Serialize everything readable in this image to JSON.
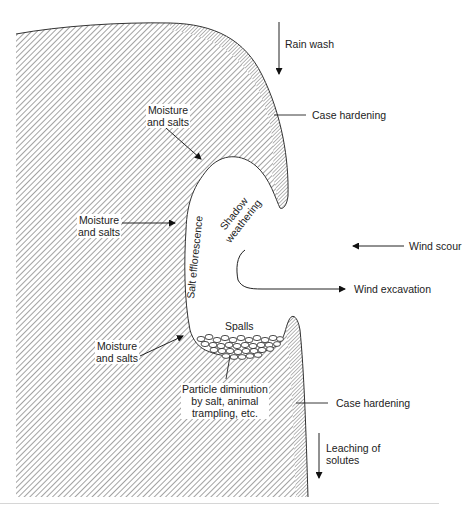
{
  "diagram": {
    "colors": {
      "rock_hatch": "#7a7a7a",
      "outline": "#333333",
      "text": "#222222",
      "background": "#ffffff"
    },
    "labels": {
      "rain_wash": "Rain wash",
      "case_hardening_top": "Case hardening",
      "moisture_top": [
        "Moisture",
        "and salts"
      ],
      "moisture_mid": [
        "Moisture",
        "and salts"
      ],
      "moisture_low": [
        "Moisture",
        "and salts"
      ],
      "salt_efflorescence": "Salt efflorescence",
      "shadow_weathering": [
        "Shadow",
        "weathering"
      ],
      "wind_scour": "Wind scour",
      "wind_excavation": "Wind excavation",
      "spalls": "Spalls",
      "particle_diminution": [
        "Particle diminution",
        "by salt, animal",
        "trampling, etc."
      ],
      "case_hardening_bottom": "Case hardening",
      "leaching": [
        "Leaching of",
        "solutes"
      ]
    },
    "arrows": [
      {
        "name": "rain-wash-arrow",
        "direction": "down"
      },
      {
        "name": "wind-scour-arrow",
        "direction": "left"
      },
      {
        "name": "wind-excavation-arrow",
        "direction": "right"
      },
      {
        "name": "leaching-arrow",
        "direction": "down"
      },
      {
        "name": "moisture-top-arrow",
        "direction": "down-right"
      },
      {
        "name": "moisture-mid-arrow",
        "direction": "right"
      },
      {
        "name": "moisture-low-arrow",
        "direction": "up-right"
      }
    ]
  }
}
